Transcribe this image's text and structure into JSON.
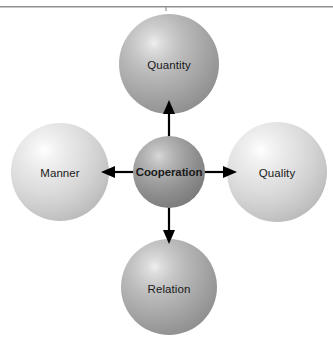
{
  "diagram": {
    "title": "Cooperation",
    "type": "radial-cross",
    "background_color": "#ffffff",
    "top_rule": {
      "name": "top-divider-rule",
      "color": "#8f8f8f"
    },
    "nodes": [
      {
        "id": "quantity",
        "label": "Quantity",
        "position": "top",
        "shade": "medium",
        "fill_color": "#a9a9a9",
        "text_color": "#1a1a1a",
        "bold": false,
        "center_x": 169,
        "center_y": 64,
        "radius": 50
      },
      {
        "id": "manner",
        "label": "Manner",
        "position": "left",
        "shade": "light",
        "fill_color": "#d1d1d1",
        "text_color": "#1a1a1a",
        "bold": false,
        "center_x": 60,
        "center_y": 172,
        "radius": 49
      },
      {
        "id": "cooperation",
        "label": "Cooperation",
        "position": "center",
        "shade": "dark",
        "fill_color": "#8d8d8d",
        "text_color": "#1a1a1a",
        "bold": true,
        "center_x": 169,
        "center_y": 172,
        "radius": 36
      },
      {
        "id": "quality",
        "label": "Quality",
        "position": "right",
        "shade": "light",
        "fill_color": "#d1d1d1",
        "text_color": "#1a1a1a",
        "bold": false,
        "center_x": 277,
        "center_y": 172,
        "radius": 50
      },
      {
        "id": "relation",
        "label": "Relation",
        "position": "bottom",
        "shade": "medium",
        "fill_color": "#a9a9a9",
        "text_color": "#1a1a1a",
        "bold": false,
        "center_x": 169,
        "center_y": 287,
        "radius": 48
      }
    ],
    "arrows": [
      {
        "id": "arrow-up",
        "from": "cooperation",
        "to": "quantity",
        "direction": "up",
        "color": "#000000",
        "line_width": 2.2,
        "head": "solid-triangle"
      },
      {
        "id": "arrow-left",
        "from": "cooperation",
        "to": "manner",
        "direction": "left",
        "color": "#000000",
        "line_width": 2.2,
        "head": "solid-triangle"
      },
      {
        "id": "arrow-right",
        "from": "cooperation",
        "to": "quality",
        "direction": "right",
        "color": "#000000",
        "line_width": 2.2,
        "head": "solid-triangle"
      },
      {
        "id": "arrow-down",
        "from": "cooperation",
        "to": "relation",
        "direction": "down",
        "color": "#000000",
        "line_width": 2.2,
        "head": "solid-triangle"
      }
    ]
  }
}
